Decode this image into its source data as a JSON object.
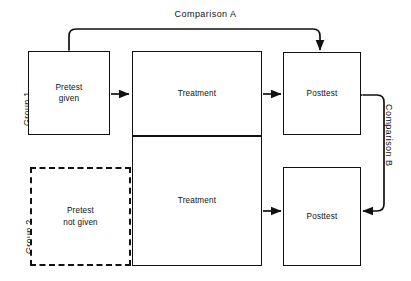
{
  "diagram": {
    "line_color": "#111111",
    "background_color": "#ffffff",
    "groups": [
      {
        "id": "group-1",
        "label": "Group 1"
      },
      {
        "id": "group-2",
        "label": "Group 2"
      }
    ],
    "boxes": [
      {
        "id": "pretest-given",
        "label": "Pretest\ngiven",
        "style": "solid",
        "row": 1,
        "column": "pretest"
      },
      {
        "id": "treatment-1",
        "label": "Treatment",
        "style": "solid",
        "row": 1,
        "column": "treatment"
      },
      {
        "id": "posttest-1",
        "label": "Posttest",
        "style": "solid",
        "row": 1,
        "column": "posttest"
      },
      {
        "id": "pretest-not-given",
        "label": "Pretest\nnot given",
        "style": "dashed",
        "row": 2,
        "column": "pretest"
      },
      {
        "id": "treatment-2",
        "label": "Treatment",
        "style": "solid",
        "row": 2,
        "column": "treatment"
      },
      {
        "id": "posttest-2",
        "label": "Posttest",
        "style": "solid",
        "row": 2,
        "column": "posttest"
      }
    ],
    "comparisons": [
      {
        "id": "comparison-a",
        "label": "Comparison A",
        "orientation": "horizontal",
        "connects": [
          "pretest-given",
          "posttest-1"
        ]
      },
      {
        "id": "comparison-b",
        "label": "Comparison B",
        "orientation": "vertical",
        "connects": [
          "posttest-1",
          "posttest-2"
        ]
      }
    ],
    "flow_arrows": [
      {
        "from": "pretest-given",
        "to": "treatment-1"
      },
      {
        "from": "treatment-1",
        "to": "posttest-1"
      },
      {
        "from": "pretest-not-given",
        "to": "treatment-2"
      },
      {
        "from": "treatment-2",
        "to": "posttest-2"
      }
    ]
  }
}
